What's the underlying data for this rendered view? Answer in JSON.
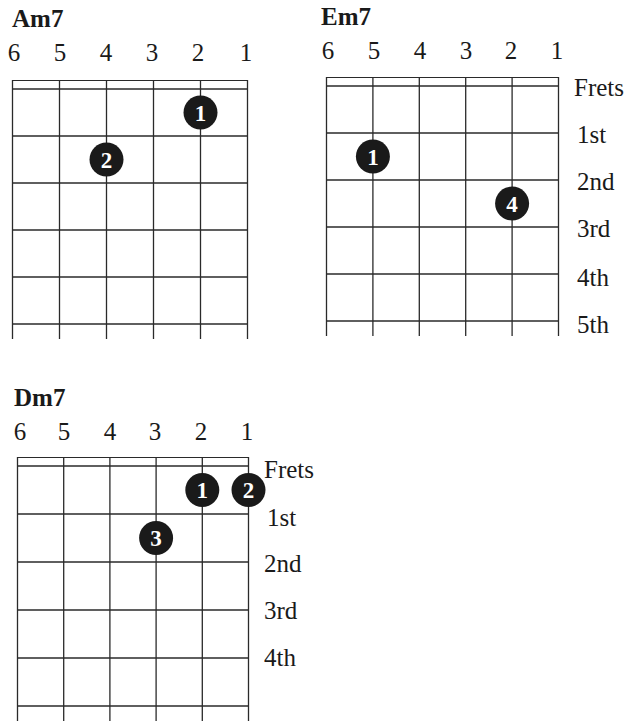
{
  "string_numbers": [
    "6",
    "5",
    "4",
    "3",
    "2",
    "1"
  ],
  "fret_labels": [
    "Frets",
    "1st",
    "2nd",
    "3rd",
    "4th",
    "5th"
  ],
  "colors": {
    "line": "#2a2a2a",
    "dot": "#1a1a1a",
    "dot_text": "#ffffff"
  },
  "chords": [
    {
      "name": "Am7",
      "show_fret_labels": false,
      "dots": [
        {
          "string": 2,
          "fret": 1,
          "finger": "1"
        },
        {
          "string": 4,
          "fret": 2,
          "finger": "2"
        }
      ]
    },
    {
      "name": "Em7",
      "show_fret_labels": true,
      "dots": [
        {
          "string": 5,
          "fret": 2,
          "finger": "1"
        },
        {
          "string": 2,
          "fret": 3,
          "finger": "4"
        }
      ]
    },
    {
      "name": "Dm7",
      "show_fret_labels": true,
      "dots": [
        {
          "string": 2,
          "fret": 1,
          "finger": "1"
        },
        {
          "string": 1,
          "fret": 1,
          "finger": "2"
        },
        {
          "string": 3,
          "fret": 2,
          "finger": "3"
        }
      ]
    }
  ]
}
